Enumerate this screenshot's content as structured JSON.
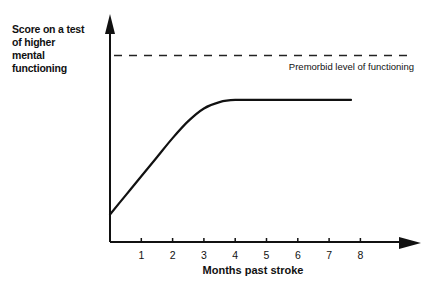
{
  "chart_data": {
    "type": "line",
    "title": "",
    "xlabel": "Months past stroke",
    "ylabel_lines": [
      "Score on a test",
      "of higher",
      "mental",
      "functioning"
    ],
    "x_ticks": [
      1,
      2,
      3,
      4,
      5,
      6,
      7,
      8
    ],
    "xlim": [
      0,
      9
    ],
    "ylim": [
      0,
      100
    ],
    "y_ticks": [],
    "grid": false,
    "series": [
      {
        "name": "Recovery curve",
        "points": [
          [
            0,
            13
          ],
          [
            0.5,
            22
          ],
          [
            1,
            31
          ],
          [
            1.5,
            40
          ],
          [
            2,
            49
          ],
          [
            2.5,
            57
          ],
          [
            3,
            63
          ],
          [
            3.5,
            66
          ],
          [
            4,
            67
          ],
          [
            5,
            67
          ],
          [
            6,
            67
          ],
          [
            7,
            67
          ],
          [
            7.7,
            67
          ]
        ]
      }
    ],
    "reference_lines": [
      {
        "name": "Premorbid level of functioning",
        "y": 88,
        "style": "dashed",
        "label": "Premorbid level of functioning"
      }
    ],
    "colors": {
      "ink": "#111111",
      "background": "#ffffff"
    }
  }
}
